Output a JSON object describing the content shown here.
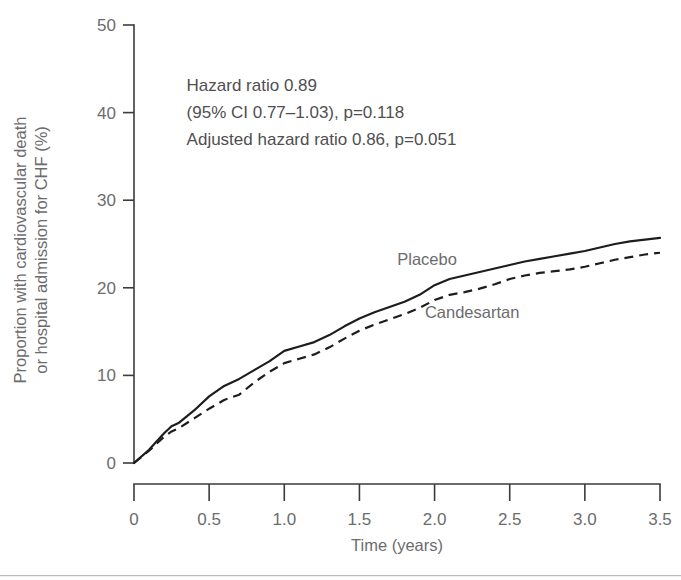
{
  "chart_data": {
    "type": "line",
    "title": "",
    "subtitle": "",
    "xlabel": "Time (years)",
    "ylabel": "Proportion with cardiovascular death or hospital admission for CHF (%)",
    "ylabel_line1": "Proportion with cardiovascular death",
    "ylabel_line2": "or hospital admission for CHF (%)",
    "xlim": [
      0,
      3.5
    ],
    "ylim": [
      0,
      50
    ],
    "xticks": [
      0,
      0.5,
      1.0,
      1.5,
      2.0,
      2.5,
      3.0,
      3.5
    ],
    "xticklabels": [
      "0",
      "0.5",
      "1.0",
      "1.5",
      "2.0",
      "2.5",
      "3.0",
      "3.5"
    ],
    "yticks": [
      0,
      10,
      20,
      30,
      40,
      50
    ],
    "yticklabels": [
      "0",
      "10",
      "20",
      "30",
      "40",
      "50"
    ],
    "grid": false,
    "legend_position": "inline-curve-labels",
    "series": [
      {
        "name": "Placebo",
        "style": "solid",
        "label_x": 1.95,
        "label_y": 22.6,
        "x": [
          0,
          0.1,
          0.2,
          0.25,
          0.3,
          0.4,
          0.5,
          0.6,
          0.7,
          0.8,
          0.9,
          1.0,
          1.1,
          1.2,
          1.3,
          1.4,
          1.5,
          1.6,
          1.7,
          1.8,
          1.9,
          2.0,
          2.1,
          2.2,
          2.3,
          2.4,
          2.5,
          2.6,
          2.7,
          2.8,
          2.9,
          3.0,
          3.1,
          3.2,
          3.3,
          3.4,
          3.5
        ],
        "y": [
          0,
          1.5,
          3.4,
          4.2,
          4.6,
          6.0,
          7.6,
          8.8,
          9.6,
          10.6,
          11.6,
          12.8,
          13.3,
          13.8,
          14.6,
          15.6,
          16.5,
          17.2,
          17.8,
          18.4,
          19.2,
          20.3,
          21.0,
          21.4,
          21.8,
          22.2,
          22.6,
          23.0,
          23.3,
          23.6,
          23.9,
          24.2,
          24.6,
          25.0,
          25.3,
          25.5,
          25.7
        ]
      },
      {
        "name": "Candesartan",
        "style": "dashed",
        "label_x": 2.25,
        "label_y": 16.6,
        "x": [
          0,
          0.1,
          0.2,
          0.25,
          0.3,
          0.4,
          0.5,
          0.6,
          0.7,
          0.8,
          0.9,
          1.0,
          1.1,
          1.2,
          1.3,
          1.4,
          1.5,
          1.6,
          1.7,
          1.8,
          1.9,
          2.0,
          2.1,
          2.2,
          2.3,
          2.4,
          2.5,
          2.6,
          2.7,
          2.8,
          2.9,
          3.0,
          3.1,
          3.2,
          3.3,
          3.4,
          3.5
        ],
        "y": [
          0,
          1.4,
          3.0,
          3.6,
          4.0,
          5.1,
          6.2,
          7.2,
          7.8,
          9.2,
          10.4,
          11.4,
          11.9,
          12.4,
          13.2,
          14.2,
          15.1,
          15.8,
          16.4,
          17.0,
          17.7,
          18.6,
          19.2,
          19.5,
          19.9,
          20.4,
          21.0,
          21.4,
          21.7,
          21.9,
          22.1,
          22.4,
          22.8,
          23.2,
          23.5,
          23.8,
          24.0
        ]
      }
    ],
    "annotations": [
      {
        "id": "hazard-ratio",
        "text": "Hazard ratio 0.89",
        "x": 0.35,
        "y": 42.5
      },
      {
        "id": "confidence-interval",
        "text": "(95% CI 0.77–1.03), p=0.118",
        "x": 0.35,
        "y": 39.4
      },
      {
        "id": "adjusted-hazard-ratio",
        "text": "Adjusted hazard ratio 0.86, p=0.051",
        "x": 0.35,
        "y": 36.3
      }
    ],
    "colors": {
      "axis": "#3b3b3d",
      "curve": "#1d1d1f",
      "tick_label": "#6c6c6e",
      "annotation": "#4f4f51",
      "background": "#ffffff"
    }
  }
}
